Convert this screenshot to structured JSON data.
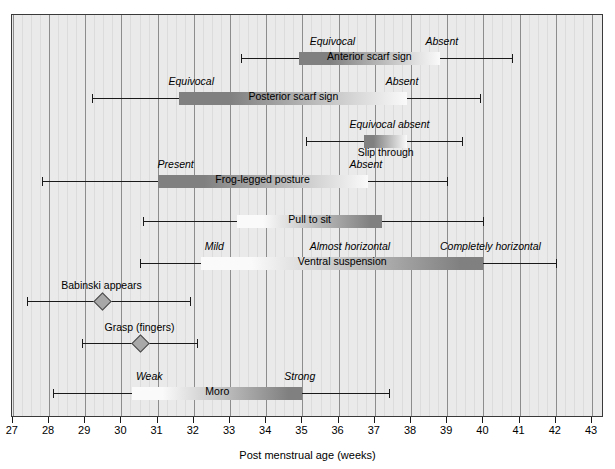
{
  "chart_data": {
    "type": "bar",
    "title": "",
    "xlabel": "Post menstrual age (weeks)",
    "ylabel": "",
    "xlim": [
      27,
      43
    ],
    "xticks": [
      27,
      28,
      29,
      30,
      31,
      32,
      33,
      34,
      35,
      36,
      37,
      38,
      39,
      40,
      41,
      42,
      43
    ],
    "grid": "vertical gridlines at each week with lighter minor lines",
    "legend": "none",
    "rows": [
      {
        "name": "Anterior scarf sign",
        "marker": "gradient-bar",
        "range_start": 33.3,
        "range_end": 40.8,
        "bar_start": 34.9,
        "bar_end": 38.8,
        "gradient": "dark-to-light",
        "label_position": "on-bar",
        "stages": [
          {
            "text": "Equivocal",
            "week": 35.2,
            "align": "left"
          },
          {
            "text": "Absent",
            "week": 38.4,
            "align": "left"
          }
        ]
      },
      {
        "name": "Posterior scarf sign",
        "marker": "gradient-bar",
        "range_start": 29.2,
        "range_end": 39.9,
        "bar_start": 31.6,
        "bar_end": 37.9,
        "gradient": "dark-to-light",
        "label_position": "on-bar",
        "stages": [
          {
            "text": "Equivocal",
            "week": 31.3,
            "align": "left"
          },
          {
            "text": "Absent",
            "week": 37.3,
            "align": "left"
          }
        ]
      },
      {
        "name": "Slip through",
        "marker": "gradient-bar",
        "range_start": 35.1,
        "range_end": 39.4,
        "bar_start": 36.7,
        "bar_end": 37.9,
        "gradient": "dark-to-light",
        "label_position": "below-bar",
        "stages": [
          {
            "text": "Equivocal absent",
            "week": 36.3,
            "align": "left"
          }
        ]
      },
      {
        "name": "Frog-legged posture",
        "marker": "gradient-bar",
        "range_start": 27.8,
        "range_end": 39.0,
        "bar_start": 31.0,
        "bar_end": 36.8,
        "gradient": "dark-to-light",
        "label_position": "on-bar",
        "stages": [
          {
            "text": "Present",
            "week": 31.0,
            "align": "left"
          },
          {
            "text": "Absent",
            "week": 36.3,
            "align": "left"
          }
        ]
      },
      {
        "name": "Pull to sit",
        "marker": "gradient-bar",
        "range_start": 30.6,
        "range_end": 40.0,
        "bar_start": 33.2,
        "bar_end": 37.2,
        "gradient": "light-to-dark",
        "label_position": "on-bar",
        "stages": []
      },
      {
        "name": "Ventral suspension",
        "marker": "gradient-bar",
        "range_start": 30.5,
        "range_end": 42.0,
        "bar_start": 32.2,
        "bar_end": 40.0,
        "gradient": "light-to-dark",
        "label_position": "on-bar",
        "stages": [
          {
            "text": "Mild",
            "week": 32.3,
            "align": "left"
          },
          {
            "text": "Almost horizontal",
            "week": 35.2,
            "align": "left"
          },
          {
            "text": "Completely horizontal",
            "week": 38.8,
            "align": "left"
          }
        ]
      },
      {
        "name": "Babinski appears",
        "marker": "diamond",
        "range_start": 27.4,
        "range_end": 31.9,
        "point": 29.45,
        "label_position": "above-point",
        "stages": []
      },
      {
        "name": "Grasp (fingers)",
        "marker": "diamond",
        "range_start": 28.9,
        "range_end": 32.1,
        "point": 30.5,
        "label_position": "above-point",
        "stages": []
      },
      {
        "name": "Moro",
        "marker": "gradient-bar",
        "range_start": 28.1,
        "range_end": 37.4,
        "bar_start": 30.3,
        "bar_end": 35.0,
        "gradient": "light-to-dark",
        "label_position": "on-bar",
        "stages": [
          {
            "text": "Weak",
            "week": 30.4,
            "align": "left"
          },
          {
            "text": "Strong",
            "week": 34.5,
            "align": "left"
          }
        ]
      }
    ],
    "colors": {
      "panel_background": "#eaeaea",
      "gridline_major": "#8d8d8d",
      "gridline_minor": "#dcdcdc",
      "line": "#1a1a1a",
      "bar_dark": "#808080",
      "bar_light": "#fafafa",
      "marker_fill": "#a8a8a8",
      "marker_edge": "#4a4a4a",
      "text": "#000000"
    }
  }
}
